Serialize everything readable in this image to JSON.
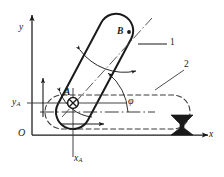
{
  "figure": {
    "kind": "kinematics-diagram",
    "background_color": "#ffffff",
    "ink_color": "#1a1a1a"
  },
  "axes": {
    "origin_label": "O",
    "y_label": "y",
    "x_label": "x",
    "ya_label": "y",
    "ya_subscript": "A",
    "xa_label": "x",
    "xa_subscript": "A"
  },
  "points": [
    {
      "id": "A",
      "label": "A",
      "marker": "crossed-circle"
    },
    {
      "id": "B",
      "label": "B",
      "marker": "filled-dot"
    }
  ],
  "annotations": {
    "angle_label": "φ",
    "body_position_1": "1",
    "body_position_2": "2"
  }
}
